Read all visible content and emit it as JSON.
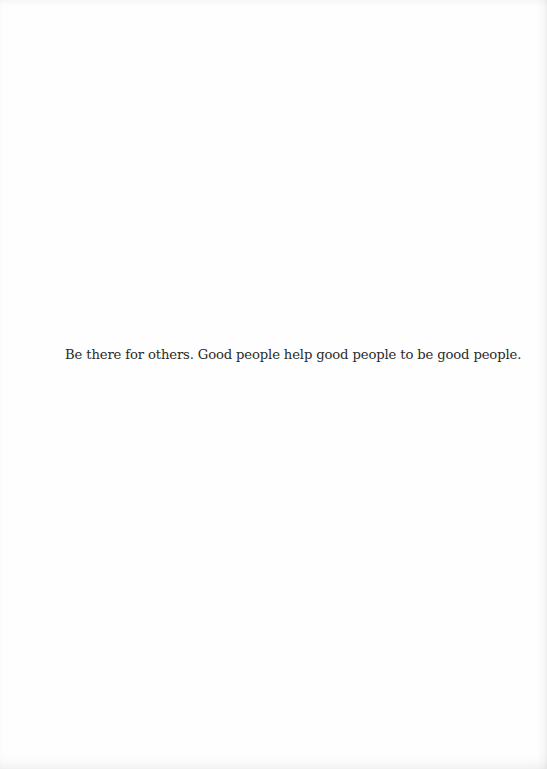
{
  "document": {
    "body_text": "Be there for others. Good people help good people to be good people."
  }
}
